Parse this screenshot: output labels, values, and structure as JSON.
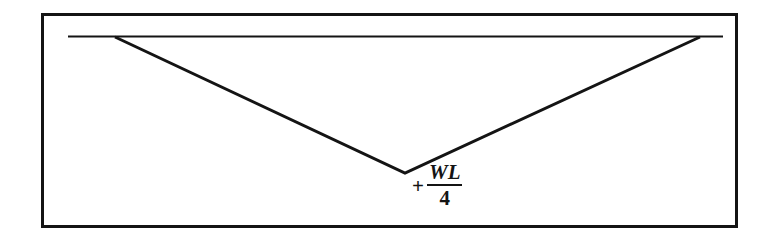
{
  "figure": {
    "background_color": "#ffffff",
    "line_color": "#141414",
    "border": {
      "x": 41,
      "y": 13,
      "width": 697,
      "height": 215,
      "thickness": 3
    }
  },
  "label": {
    "sign": "+",
    "numerator": "WL",
    "denominator": "4",
    "full_text": "+ WL/4"
  },
  "chart_data": {
    "type": "line",
    "subtitle": "",
    "xlabel": "",
    "ylabel": "",
    "grid": false,
    "legend": "none",
    "xlim": [
      0,
      772
    ],
    "ylim": [
      0,
      245
    ],
    "annotations": [
      {
        "text": "+ WL/4",
        "x": 420,
        "y": 182,
        "describes": "maximum positive bending moment at midspan"
      }
    ],
    "series": [
      {
        "name": "datum-line",
        "kind": "horizontal-baseline",
        "stroke_width": 2,
        "points": [
          {
            "x": 68,
            "y": 36
          },
          {
            "x": 723,
            "y": 36
          }
        ]
      },
      {
        "name": "moment-curve",
        "kind": "triangular-moment-diagram",
        "stroke_width": 3,
        "points": [
          {
            "x": 115,
            "y": 37
          },
          {
            "x": 405,
            "y": 173
          },
          {
            "x": 700,
            "y": 37
          }
        ]
      }
    ]
  }
}
